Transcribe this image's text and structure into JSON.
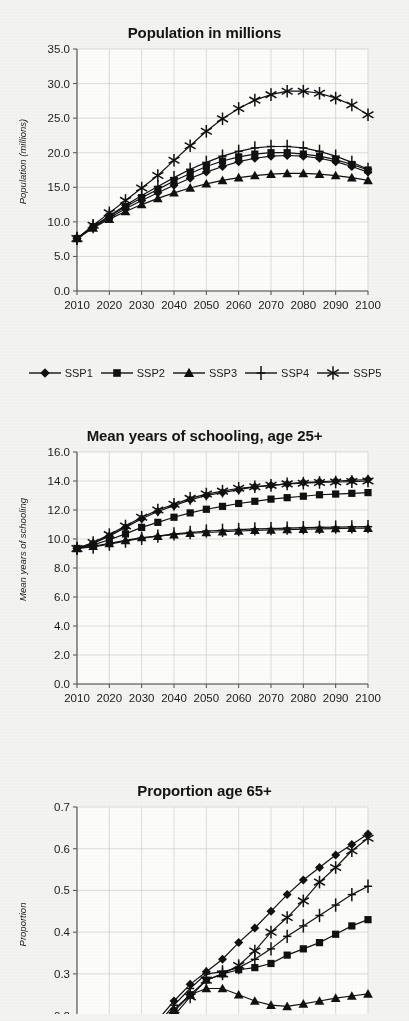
{
  "figure": {
    "background_color": "#f4f4f2",
    "line_color": "#111111",
    "grid_color": "#cfcfcf",
    "axis_color": "#4d4d4d"
  },
  "legend": {
    "items": [
      {
        "label": "SSP1",
        "marker": "diamond"
      },
      {
        "label": "SSP2",
        "marker": "square"
      },
      {
        "label": "SSP3",
        "marker": "triangle"
      },
      {
        "label": "SSP4",
        "marker": "plus"
      },
      {
        "label": "SSP5",
        "marker": "asterisk"
      }
    ]
  },
  "chart_data": [
    {
      "id": "population",
      "type": "line",
      "title": "Population in millions",
      "xlabel": "",
      "ylabel": "Population (millions)",
      "x": [
        2010,
        2015,
        2020,
        2025,
        2030,
        2035,
        2040,
        2045,
        2050,
        2055,
        2060,
        2065,
        2070,
        2075,
        2080,
        2085,
        2090,
        2095,
        2100
      ],
      "xlim": [
        2010,
        2100
      ],
      "ylim": [
        0.0,
        35.0
      ],
      "yticks": [
        "0.0",
        "5.0",
        "10.0",
        "15.0",
        "20.0",
        "25.0",
        "30.0",
        "35.0"
      ],
      "xticks": [
        "2010",
        "2020",
        "2030",
        "2040",
        "2050",
        "2060",
        "2070",
        "2080",
        "2090",
        "2100"
      ],
      "grid": true,
      "legend_position": "below",
      "series": [
        {
          "name": "SSP1",
          "marker": "diamond",
          "values": [
            7.6,
            9.2,
            10.6,
            11.9,
            13.1,
            14.2,
            15.3,
            16.3,
            17.2,
            18.0,
            18.7,
            19.2,
            19.5,
            19.6,
            19.5,
            19.2,
            18.7,
            18.0,
            17.2
          ]
        },
        {
          "name": "SSP2",
          "marker": "square",
          "values": [
            7.6,
            9.3,
            10.8,
            12.2,
            13.5,
            14.7,
            15.9,
            17.0,
            18.0,
            18.8,
            19.4,
            19.8,
            20.0,
            20.0,
            19.8,
            19.5,
            19.0,
            18.3,
            17.5
          ]
        },
        {
          "name": "SSP3",
          "marker": "triangle",
          "values": [
            7.6,
            9.1,
            10.4,
            11.5,
            12.5,
            13.4,
            14.2,
            14.9,
            15.5,
            16.0,
            16.4,
            16.7,
            16.9,
            17.0,
            17.0,
            16.9,
            16.7,
            16.4,
            16.0
          ]
        },
        {
          "name": "SSP4",
          "marker": "plus",
          "values": [
            7.6,
            9.3,
            10.9,
            12.4,
            13.8,
            15.1,
            16.4,
            17.6,
            18.6,
            19.5,
            20.2,
            20.7,
            20.9,
            20.9,
            20.7,
            20.2,
            19.5,
            18.6,
            17.6
          ]
        },
        {
          "name": "SSP5",
          "marker": "asterisk",
          "values": [
            7.6,
            9.5,
            11.3,
            13.1,
            14.9,
            16.7,
            18.9,
            21.0,
            23.1,
            24.9,
            26.4,
            27.6,
            28.4,
            28.9,
            28.9,
            28.6,
            27.9,
            26.9,
            25.5
          ]
        }
      ]
    },
    {
      "id": "schooling",
      "type": "line",
      "title": "Mean years of schooling, age 25+",
      "xlabel": "",
      "ylabel": "Mean years of schooling",
      "x": [
        2010,
        2015,
        2020,
        2025,
        2030,
        2035,
        2040,
        2045,
        2050,
        2055,
        2060,
        2065,
        2070,
        2075,
        2080,
        2085,
        2090,
        2095,
        2100
      ],
      "xlim": [
        2010,
        2100
      ],
      "ylim": [
        0.0,
        16.0
      ],
      "yticks": [
        "0.0",
        "2.0",
        "4.0",
        "6.0",
        "8.0",
        "10.0",
        "12.0",
        "14.0",
        "16.0"
      ],
      "xticks": [
        "2010",
        "2020",
        "2030",
        "2040",
        "2050",
        "2060",
        "2070",
        "2080",
        "2090",
        "2100"
      ],
      "grid": true,
      "legend_position": "none",
      "series": [
        {
          "name": "SSP1",
          "marker": "diamond",
          "values": [
            9.35,
            9.7,
            10.2,
            10.8,
            11.4,
            11.9,
            12.3,
            12.7,
            13.0,
            13.2,
            13.4,
            13.6,
            13.7,
            13.8,
            13.9,
            13.95,
            14.0,
            14.05,
            14.1
          ]
        },
        {
          "name": "SSP2",
          "marker": "square",
          "values": [
            9.35,
            9.6,
            9.95,
            10.35,
            10.8,
            11.15,
            11.5,
            11.8,
            12.05,
            12.25,
            12.45,
            12.6,
            12.75,
            12.85,
            12.95,
            13.05,
            13.1,
            13.15,
            13.2
          ]
        },
        {
          "name": "SSP3",
          "marker": "triangle",
          "values": [
            9.35,
            9.5,
            9.7,
            9.9,
            10.1,
            10.2,
            10.3,
            10.4,
            10.45,
            10.5,
            10.55,
            10.6,
            10.62,
            10.65,
            10.68,
            10.7,
            10.72,
            10.74,
            10.75
          ]
        },
        {
          "name": "SSP4",
          "marker": "plus",
          "values": [
            9.35,
            9.45,
            9.65,
            9.85,
            10.05,
            10.2,
            10.35,
            10.45,
            10.55,
            10.6,
            10.65,
            10.7,
            10.72,
            10.75,
            10.78,
            10.8,
            10.82,
            10.84,
            10.85
          ]
        },
        {
          "name": "SSP5",
          "marker": "asterisk",
          "values": [
            9.35,
            9.75,
            10.3,
            10.9,
            11.5,
            12.0,
            12.4,
            12.8,
            13.1,
            13.3,
            13.5,
            13.6,
            13.7,
            13.8,
            13.85,
            13.9,
            13.93,
            13.96,
            14.0
          ]
        }
      ]
    },
    {
      "id": "proportion65",
      "type": "line",
      "title": "Proportion age 65+",
      "xlabel": "",
      "ylabel": "Proportion",
      "x": [
        2010,
        2015,
        2020,
        2025,
        2030,
        2035,
        2040,
        2045,
        2050,
        2055,
        2060,
        2065,
        2070,
        2075,
        2080,
        2085,
        2090,
        2095,
        2100
      ],
      "xlim": [
        2010,
        2100
      ],
      "ylim": [
        0.12,
        0.7
      ],
      "yticks": [
        "0.2",
        "0.3",
        "0.4",
        "0.5",
        "0.6",
        "0.7"
      ],
      "xticks": [
        "2010",
        "2020",
        "2030",
        "2040",
        "2050",
        "2060",
        "2070",
        "2080",
        "2090",
        "2100"
      ],
      "grid": true,
      "legend_position": "none",
      "note": "lower portion of chart is cropped by the image edge",
      "series": [
        {
          "name": "SSP1",
          "marker": "diamond",
          "values": [
            0.055,
            0.07,
            0.09,
            0.115,
            0.15,
            0.19,
            0.235,
            0.275,
            0.305,
            0.335,
            0.375,
            0.41,
            0.45,
            0.49,
            0.525,
            0.555,
            0.585,
            0.61,
            0.635
          ]
        },
        {
          "name": "SSP2",
          "marker": "square",
          "values": [
            0.055,
            0.07,
            0.085,
            0.105,
            0.135,
            0.17,
            0.21,
            0.25,
            0.285,
            0.3,
            0.31,
            0.315,
            0.325,
            0.345,
            0.36,
            0.375,
            0.395,
            0.415,
            0.43
          ]
        },
        {
          "name": "SSP3",
          "marker": "triangle",
          "values": [
            0.055,
            0.07,
            0.085,
            0.105,
            0.135,
            0.17,
            0.215,
            0.25,
            0.265,
            0.265,
            0.25,
            0.235,
            0.225,
            0.222,
            0.228,
            0.235,
            0.242,
            0.247,
            0.252
          ]
        },
        {
          "name": "SSP4",
          "marker": "plus",
          "values": [
            0.055,
            0.07,
            0.088,
            0.11,
            0.14,
            0.18,
            0.225,
            0.265,
            0.3,
            0.305,
            0.315,
            0.335,
            0.36,
            0.39,
            0.415,
            0.44,
            0.465,
            0.49,
            0.51
          ]
        },
        {
          "name": "SSP5",
          "marker": "asterisk",
          "values": [
            0.055,
            0.065,
            0.08,
            0.1,
            0.125,
            0.16,
            0.2,
            0.245,
            0.285,
            0.3,
            0.32,
            0.355,
            0.4,
            0.435,
            0.475,
            0.52,
            0.555,
            0.595,
            0.625
          ]
        }
      ]
    }
  ]
}
